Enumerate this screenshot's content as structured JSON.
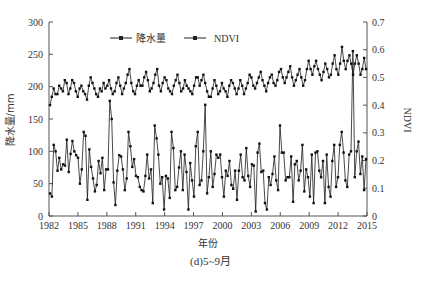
{
  "chart_data": {
    "type": "line",
    "title": "",
    "caption": "(d)5~9月",
    "xlabel": "年份",
    "ylabel": "降水量/mm",
    "y2label": "NDVI",
    "ylim": [
      0,
      300
    ],
    "y2lim": [
      0,
      0.7
    ],
    "yticks": [
      0,
      50,
      100,
      150,
      200,
      250,
      300
    ],
    "y2ticks": [
      "0",
      "0.1",
      "0.2",
      "0.3",
      "0.4",
      "0.5",
      "0.6",
      "0.7"
    ],
    "xticks": [
      "1982",
      "1985",
      "1988",
      "1991",
      "1994",
      "1997",
      "2000",
      "2003",
      "2006",
      "2009",
      "2012",
      "2015"
    ],
    "xrange": [
      1982,
      2015
    ],
    "grid": false,
    "legend": {
      "position": "top-center",
      "entries": [
        "降水量",
        "NDVI"
      ]
    },
    "points_per_year": 5,
    "series": [
      {
        "name": "降水量",
        "axis": "left",
        "values": [
          35,
          30,
          110,
          100,
          70,
          90,
          72,
          80,
          78,
          118,
          68,
          96,
          116,
          100,
          94,
          90,
          50,
          72,
          130,
          124,
          25,
          103,
          76,
          58,
          38,
          48,
          85,
          66,
          90,
          40,
          72,
          72,
          178,
          150,
          52,
          17,
          70,
          94,
          92,
          72,
          40,
          58,
          130,
          108,
          76,
          88,
          62,
          60,
          45,
          40,
          38,
          62,
          95,
          58,
          72,
          20,
          140,
          120,
          95,
          50,
          60,
          10,
          62,
          58,
          28,
          130,
          105,
          40,
          45,
          75,
          100,
          40,
          95,
          68,
          10,
          82,
          55,
          30,
          108,
          130,
          48,
          55,
          100,
          172,
          35,
          60,
          100,
          45,
          65,
          95,
          90,
          95,
          60,
          30,
          70,
          62,
          85,
          48,
          42,
          70,
          25,
          70,
          95,
          60,
          55,
          105,
          62,
          45,
          80,
          78,
          7,
          98,
          112,
          68,
          70,
          20,
          10,
          60,
          48,
          65,
          92,
          55,
          40,
          140,
          98,
          98,
          55,
          60,
          60,
          92,
          22,
          80,
          85,
          55,
          70,
          110,
          38,
          72,
          60,
          30,
          95,
          20,
          98,
          100,
          70,
          60,
          85,
          20,
          95,
          45,
          30,
          85,
          110,
          45,
          60,
          110,
          130,
          98,
          55,
          45,
          95,
          100,
          255,
          60,
          100,
          115,
          65,
          92,
          40,
          88
        ]
      },
      {
        "name": "NDVI",
        "axis": "right",
        "values": [
          0.4,
          0.43,
          0.46,
          0.44,
          0.44,
          0.47,
          0.46,
          0.45,
          0.49,
          0.48,
          0.44,
          0.46,
          0.49,
          0.48,
          0.45,
          0.43,
          0.46,
          0.47,
          0.45,
          0.44,
          0.42,
          0.47,
          0.5,
          0.48,
          0.46,
          0.44,
          0.43,
          0.46,
          0.45,
          0.48,
          0.46,
          0.47,
          0.49,
          0.46,
          0.44,
          0.45,
          0.48,
          0.5,
          0.47,
          0.44,
          0.46,
          0.48,
          0.51,
          0.53,
          0.48,
          0.45,
          0.44,
          0.47,
          0.49,
          0.47,
          0.47,
          0.5,
          0.52,
          0.49,
          0.45,
          0.46,
          0.48,
          0.51,
          0.53,
          0.47,
          0.45,
          0.48,
          0.5,
          0.49,
          0.46,
          0.45,
          0.44,
          0.47,
          0.49,
          0.51,
          0.48,
          0.45,
          0.46,
          0.49,
          0.47,
          0.46,
          0.45,
          0.44,
          0.47,
          0.5,
          0.5,
          0.47,
          0.49,
          0.51,
          0.48,
          0.45,
          0.43,
          0.43,
          0.46,
          0.49,
          0.47,
          0.44,
          0.45,
          0.48,
          0.46,
          0.45,
          0.43,
          0.47,
          0.49,
          0.48,
          0.46,
          0.44,
          0.46,
          0.49,
          0.47,
          0.44,
          0.46,
          0.48,
          0.51,
          0.5,
          0.47,
          0.46,
          0.48,
          0.5,
          0.52,
          0.49,
          0.47,
          0.45,
          0.48,
          0.5,
          0.51,
          0.48,
          0.47,
          0.49,
          0.52,
          0.53,
          0.5,
          0.48,
          0.5,
          0.52,
          0.54,
          0.5,
          0.47,
          0.49,
          0.51,
          0.53,
          0.5,
          0.47,
          0.49,
          0.53,
          0.56,
          0.53,
          0.51,
          0.54,
          0.56,
          0.53,
          0.51,
          0.49,
          0.52,
          0.55,
          0.53,
          0.5,
          0.51,
          0.55,
          0.58,
          0.53,
          0.51,
          0.55,
          0.61,
          0.56,
          0.53,
          0.56,
          0.58,
          0.55,
          0.51,
          0.55,
          0.58,
          0.55,
          0.51,
          0.53,
          0.57,
          0.53
        ]
      }
    ]
  }
}
